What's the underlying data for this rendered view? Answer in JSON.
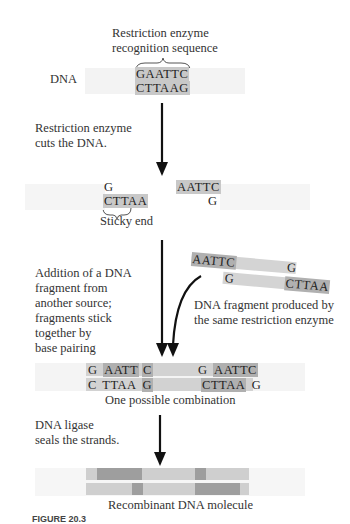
{
  "title_label": "Restriction enzyme\nrecognition sequence",
  "dna_label": "DNA",
  "recognition": {
    "top": "GAATTC",
    "bottom": "CTTAAG"
  },
  "step1_label": "Restriction enzyme\ncuts the DNA.",
  "cut": {
    "left_top": "G",
    "left_bottom": "CTTAA",
    "right_top": "AATTC",
    "right_bottom": "G",
    "sticky_label": "Sticky end"
  },
  "step2_label": "Addition of a DNA\nfragment from\nanother source;\nfragments stick\ntogether by\nbase pairing",
  "foreign_fragment": {
    "top_left": "AATTC",
    "top_right": "G",
    "bottom_left": "G",
    "bottom_right": "CTTAA",
    "label": "DNA fragment produced by\nthe same restriction enzyme"
  },
  "combination": {
    "top": [
      "G",
      "AATT",
      "C",
      "G",
      "AATTC"
    ],
    "bottom": [
      "C",
      "TTAA",
      "G",
      "CTTAA",
      "G"
    ],
    "label": "One possible combination"
  },
  "step3_label": "DNA ligase\nseals the strands.",
  "result_label": "Recombinant DNA molecule",
  "caption_fragment": "FIGURE 20.3"
}
